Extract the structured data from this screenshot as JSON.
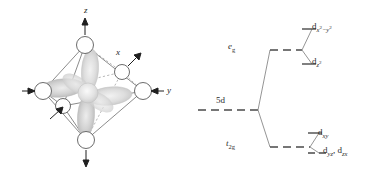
{
  "figure": {
    "stroke_color": "#555555",
    "dash_color": "#4a4a4a",
    "lobe_color": "#d8d8d8",
    "text_color": "#2b2b2b"
  },
  "octahedron": {
    "name": "octahedral-complex-with-d-orbital",
    "axes": [
      {
        "key": "z",
        "label": "z",
        "direction": "up"
      },
      {
        "key": "y",
        "label": "y",
        "direction": "right"
      },
      {
        "key": "x",
        "label": "x",
        "direction": "diagonal-upper-right"
      }
    ],
    "ligand_count": 6,
    "ligand_positions": [
      "top",
      "bottom",
      "left",
      "right",
      "front",
      "back"
    ],
    "orbital": "four-lobed d orbital"
  },
  "energy_diagram": {
    "free_ion": {
      "label": "5d",
      "style": "dashed"
    },
    "sets": [
      {
        "key": "eg",
        "label": "e",
        "sublabel": "g",
        "style": "dashed",
        "orbitals": [
          {
            "key": "dx2-y2",
            "label": "d",
            "sub": "x",
            "sup1": "2",
            "dash": "−",
            "sub2": "y",
            "sup2": "2"
          },
          {
            "key": "dz2",
            "label": "d",
            "sub": "z",
            "sup1": "2"
          }
        ]
      },
      {
        "key": "t2g",
        "label": "t",
        "sublabel": "2g",
        "style": "dashed",
        "orbitals": [
          {
            "key": "dxy",
            "label": "d",
            "sub": "xy"
          },
          {
            "key": "dyz-dzx",
            "label": "d",
            "sub": "yz",
            "label2": "d",
            "sub3": "zx"
          }
        ]
      }
    ],
    "labels": {
      "five_d": "5d",
      "eg": "e",
      "eg_sub": "g",
      "t2g": "t",
      "t2g_sub": "2g",
      "dxy": "d",
      "dxy_sub": "xy",
      "dyzzx_lead": "d",
      "dyz_sub": "yz",
      "dyzzx_mid": ", d",
      "dzx_sub": "zx",
      "dx2y2_lead": "d",
      "dx2y2_subx": "x",
      "dx2y2_supx": "2",
      "dx2y2_minus": "−",
      "dx2y2_suby": "y",
      "dx2y2_supy": "2",
      "dz2_lead": "d",
      "dz2_subz": "z",
      "dz2_supz": "2"
    }
  }
}
